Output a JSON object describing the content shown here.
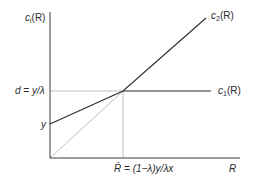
{
  "diagram": {
    "type": "line-diagram",
    "colors": {
      "axis": "#3a3a3a",
      "main_line": "#2b2b2b",
      "guide": "#b5b5b5"
    },
    "y_axis_label": {
      "c": "c",
      "sub": "i",
      "rest": "(R)"
    },
    "x_axis_label": "R",
    "curves": [
      {
        "name": "c1",
        "label_c": "c",
        "label_sub": "1",
        "label_rest": "(R)"
      },
      {
        "name": "c2",
        "label_c": "c",
        "label_sub": "2",
        "label_rest": "(R)"
      }
    ],
    "y_ticks": {
      "d_label": "d = y/λ",
      "y_label": "y"
    },
    "x_tick": {
      "bar_R": "R̄",
      "expr": " = (1−λ)y/λx"
    }
  }
}
